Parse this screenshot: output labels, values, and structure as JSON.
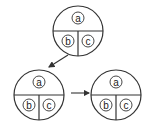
{
  "diagram": {
    "stroke_color": "#333333",
    "nodes": [
      {
        "id": "top",
        "cx": 78,
        "cy": 31,
        "r": 25,
        "cells": {
          "top": "a",
          "bottom_left": "b",
          "bottom_right": "c"
        }
      },
      {
        "id": "bottom-left",
        "cx": 39,
        "cy": 95,
        "r": 25,
        "cells": {
          "top": "a",
          "bottom_left": "b",
          "bottom_right": "c"
        }
      },
      {
        "id": "bottom-right",
        "cx": 116,
        "cy": 95,
        "r": 25,
        "cells": {
          "top": "a",
          "bottom_left": "b",
          "bottom_right": "c"
        }
      }
    ],
    "arrows": [
      {
        "from": "top",
        "to": "bottom-left"
      },
      {
        "from": "bottom-left",
        "to": "bottom-right"
      }
    ]
  }
}
